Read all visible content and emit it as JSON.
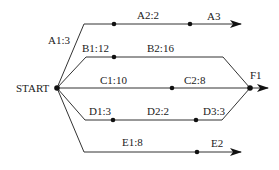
{
  "diagram": {
    "type": "activity-network",
    "colors": {
      "line": "#333333",
      "node": "#111111",
      "text": "#222222",
      "background": "#ffffff"
    },
    "nodes": {
      "start": {
        "label": "START"
      },
      "finish": {
        "label": "F1"
      }
    },
    "branches": [
      {
        "id": "A",
        "labels": [
          "A1:3",
          "A2:2",
          "A3"
        ],
        "ends_with": "arrow"
      },
      {
        "id": "B",
        "labels": [
          "B1:12",
          "B2:16"
        ],
        "ends_with": "F1"
      },
      {
        "id": "C",
        "labels": [
          "C1:10",
          "C2:8"
        ],
        "ends_with": "F1"
      },
      {
        "id": "D",
        "labels": [
          "D1:3",
          "D2:2",
          "D3:3"
        ],
        "ends_with": "F1"
      },
      {
        "id": "E",
        "labels": [
          "E1:8",
          "E2"
        ],
        "ends_with": "arrow"
      }
    ]
  }
}
